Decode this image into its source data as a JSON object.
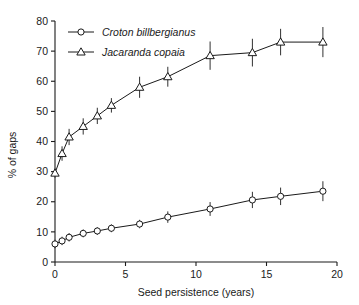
{
  "chart_data": {
    "type": "line",
    "title": "",
    "subtitle": "",
    "xlabel": "Seed persistence (years)",
    "ylabel": "% of gaps",
    "xlim": [
      0,
      20
    ],
    "ylim": [
      0,
      80
    ],
    "xticks": [
      0,
      5,
      10,
      15,
      20
    ],
    "xtick_labels": [
      "0",
      "5",
      "10",
      "15",
      "20"
    ],
    "yticks": [
      0,
      10,
      20,
      30,
      40,
      50,
      60,
      70,
      80
    ],
    "ytick_labels": [
      "0",
      "10",
      "20",
      "30",
      "40",
      "50",
      "60",
      "70",
      "80"
    ],
    "grid": false,
    "legend_position": "top-left",
    "x": [
      0,
      0.5,
      1,
      2,
      3,
      4,
      6,
      8,
      11,
      14,
      16,
      19
    ],
    "series": [
      {
        "name": "Croton billbergianus",
        "marker": "circle",
        "values": [
          6.0,
          7.0,
          8.2,
          9.5,
          10.3,
          11.2,
          12.6,
          14.9,
          17.6,
          20.6,
          21.8,
          23.5
        ],
        "error_low": [
          4.6,
          5.6,
          6.8,
          8.2,
          9.0,
          9.9,
          11.2,
          13.0,
          15.3,
          17.9,
          18.9,
          20.2
        ],
        "error_high": [
          7.4,
          8.4,
          9.6,
          10.8,
          11.6,
          12.5,
          14.0,
          16.8,
          19.9,
          23.3,
          24.7,
          26.8
        ]
      },
      {
        "name": "Jacaranda copaia",
        "marker": "triangle",
        "values": [
          29.5,
          36.0,
          41.5,
          45.0,
          48.5,
          52.0,
          58.0,
          61.5,
          68.5,
          69.5,
          73.0,
          73.0
        ],
        "error_low": [
          28.0,
          33.6,
          38.8,
          42.3,
          45.8,
          49.6,
          54.5,
          58.2,
          63.8,
          64.9,
          68.6,
          68.0
        ],
        "error_high": [
          31.0,
          38.4,
          44.2,
          47.7,
          51.2,
          54.4,
          61.5,
          64.8,
          73.2,
          74.1,
          77.4,
          78.0
        ]
      }
    ],
    "legend": [
      {
        "label": "Croton billbergianus",
        "marker": "circle"
      },
      {
        "label": "Jacaranda copaia",
        "marker": "triangle"
      }
    ],
    "colors": {
      "line": "#1a1a1a",
      "marker_fill": "#ffffff",
      "axis": "#1a1a1a",
      "background": "#ffffff"
    }
  }
}
